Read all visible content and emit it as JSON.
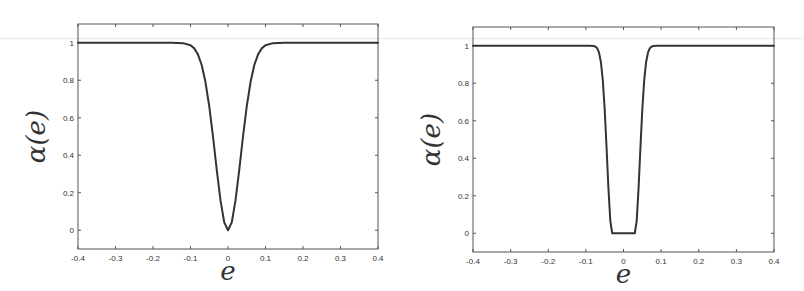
{
  "figure": {
    "background": "#ffffff",
    "axis_color": "#555555",
    "line_color": "#333333"
  },
  "chart_data": [
    {
      "type": "line",
      "title": "",
      "xlabel": "e",
      "ylabel": "α(e)",
      "xlim": [
        -0.4,
        0.4
      ],
      "ylim": [
        -0.1,
        1.1
      ],
      "xticks": [
        -0.4,
        -0.3,
        -0.2,
        -0.1,
        0,
        0.1,
        0.2,
        0.3,
        0.4
      ],
      "xtick_labels": [
        "-0.4",
        "-0.3",
        "-0.2",
        "-0.1",
        "0",
        "0.1",
        "0.2",
        "0.3",
        "0.4"
      ],
      "yticks": [
        0,
        0.2,
        0.4,
        0.6,
        0.8,
        1
      ],
      "ytick_labels": [
        "0",
        "0.2",
        "0.4",
        "0.6",
        "0.8",
        "1"
      ],
      "grid": false,
      "legend": null,
      "series": [
        {
          "name": "alpha",
          "x": [
            -0.4,
            -0.2,
            -0.15,
            -0.12,
            -0.1,
            -0.09,
            -0.08,
            -0.07,
            -0.06,
            -0.05,
            -0.04,
            -0.03,
            -0.02,
            -0.01,
            0,
            0.01,
            0.02,
            0.03,
            0.04,
            0.05,
            0.06,
            0.07,
            0.08,
            0.09,
            0.1,
            0.12,
            0.15,
            0.2,
            0.4
          ],
          "y": [
            1,
            1,
            0.9994,
            0.998,
            0.987,
            0.97,
            0.937,
            0.88,
            0.789,
            0.661,
            0.5,
            0.322,
            0.159,
            0.042,
            0,
            0.042,
            0.159,
            0.322,
            0.5,
            0.661,
            0.789,
            0.88,
            0.937,
            0.97,
            0.987,
            0.998,
            0.9994,
            1,
            1
          ]
        }
      ]
    },
    {
      "type": "line",
      "title": "",
      "xlabel": "e",
      "ylabel": "α(e)",
      "xlim": [
        -0.4,
        0.4
      ],
      "ylim": [
        -0.1,
        1.1
      ],
      "xticks": [
        -0.4,
        -0.3,
        -0.2,
        -0.1,
        0,
        0.1,
        0.2,
        0.3,
        0.4
      ],
      "xtick_labels": [
        "-0.4",
        "-0.3",
        "-0.2",
        "-0.1",
        "0",
        "0.1",
        "0.2",
        "0.3",
        "0.4"
      ],
      "yticks": [
        0,
        0.2,
        0.4,
        0.6,
        0.8,
        1
      ],
      "ytick_labels": [
        "0",
        "0.2",
        "0.4",
        "0.6",
        "0.8",
        "1"
      ],
      "grid": false,
      "legend": null,
      "series": [
        {
          "name": "alpha",
          "x": [
            -0.4,
            -0.2,
            -0.12,
            -0.1,
            -0.09,
            -0.08,
            -0.075,
            -0.07,
            -0.065,
            -0.06,
            -0.055,
            -0.05,
            -0.045,
            -0.04,
            -0.035,
            -0.03,
            0,
            0.03,
            0.035,
            0.04,
            0.045,
            0.05,
            0.055,
            0.06,
            0.065,
            0.07,
            0.075,
            0.08,
            0.09,
            0.1,
            0.12,
            0.2,
            0.4
          ],
          "y": [
            1,
            1,
            1,
            0.9999,
            0.9995,
            0.9989,
            0.996,
            0.987,
            0.963,
            0.912,
            0.815,
            0.661,
            0.456,
            0.237,
            0.065,
            0,
            0,
            0,
            0.065,
            0.237,
            0.456,
            0.661,
            0.815,
            0.912,
            0.963,
            0.987,
            0.996,
            0.9989,
            0.9995,
            0.9999,
            1,
            1,
            1
          ]
        }
      ]
    }
  ]
}
